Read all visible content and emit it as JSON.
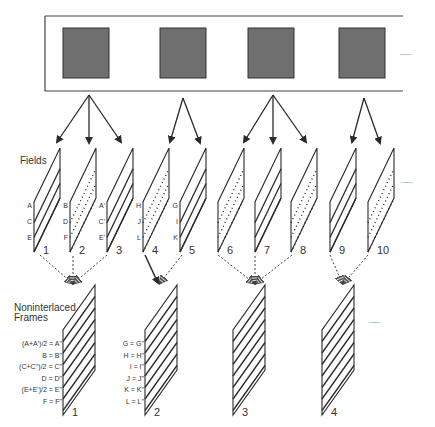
{
  "colors": {
    "stroke": "#2a2a2a",
    "film_fill": "#6f6f6f",
    "film_border": "#333333",
    "background": "#ffffff"
  },
  "film_strip": {
    "frames": 4,
    "continuation": "......"
  },
  "fields_section": {
    "heading": "Fields",
    "continuation": "......",
    "fields": [
      {
        "number": "1",
        "style": "solid",
        "labels": [
          "A",
          "C",
          "E"
        ]
      },
      {
        "number": "2",
        "style": "dotted",
        "labels": [
          "B",
          "D",
          "F"
        ]
      },
      {
        "number": "3",
        "style": "solid",
        "labels": [
          "A'",
          "C'",
          "E'"
        ]
      },
      {
        "number": "4",
        "style": "dotted",
        "labels": [
          "H",
          "J",
          "L"
        ]
      },
      {
        "number": "5",
        "style": "solid",
        "labels": [
          "G",
          "I",
          "K"
        ]
      },
      {
        "number": "6",
        "style": "dotted",
        "labels": []
      },
      {
        "number": "7",
        "style": "solid",
        "labels": []
      },
      {
        "number": "8",
        "style": "dotted",
        "labels": []
      },
      {
        "number": "9",
        "style": "solid",
        "labels": []
      },
      {
        "number": "10",
        "style": "dotted",
        "labels": []
      }
    ]
  },
  "frames_section": {
    "heading_line1": "Noninterlaced",
    "heading_line2": "Frames",
    "continuation": "......",
    "frames": [
      {
        "number": "1",
        "equations": [
          "(A+A')/2 = A\"",
          "B = B\"",
          "(C+C'')/2 = C\"",
          "D = D\"",
          "(E+E')/2 = E\"",
          "F = F\""
        ]
      },
      {
        "number": "2",
        "equations": [
          "G = G\"",
          "H = H\"",
          "I = I\"",
          "J = J\"",
          "K = K\"",
          "L = L\""
        ]
      },
      {
        "number": "3",
        "equations": []
      },
      {
        "number": "4",
        "equations": []
      }
    ]
  }
}
